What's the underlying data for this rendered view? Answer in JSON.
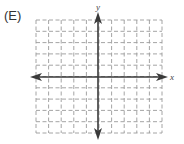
{
  "figure": {
    "option_label": "(E)",
    "x_axis_label": "x",
    "y_axis_label": "y",
    "grid": {
      "columns": 10,
      "rows": 10,
      "style": "dashed"
    },
    "colors": {
      "grid": "#9a9a9a",
      "axis": "#3a3a3a",
      "text": "#333333"
    }
  }
}
